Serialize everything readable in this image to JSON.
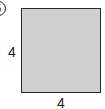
{
  "figure": {
    "badge_number": "5",
    "shape": "square",
    "fill_color": "#cfcfcf",
    "border_color": "#2a2a2a",
    "side_labels": {
      "left": "4",
      "bottom": "4"
    }
  }
}
